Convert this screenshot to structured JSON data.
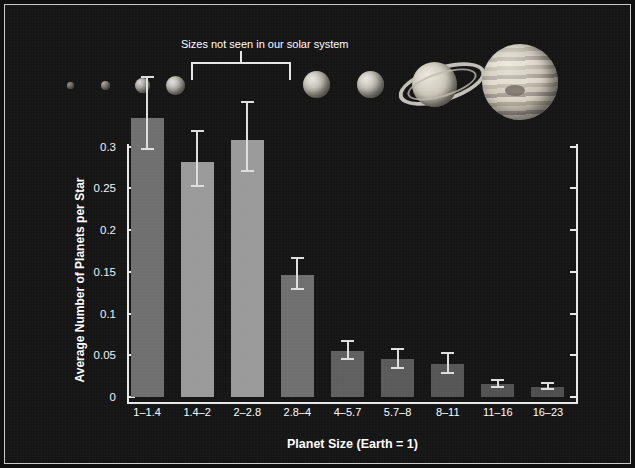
{
  "chart_data": {
    "type": "bar",
    "title": "",
    "xlabel": "Planet Size (Earth = 1)",
    "ylabel": "Average Number of Planets per Star",
    "categories": [
      "1–1.4",
      "1.4–2",
      "2–2.8",
      "2.8–4",
      "4–5.7",
      "5.7–8",
      "8–11",
      "11–16",
      "16–23"
    ],
    "values": [
      0.334,
      0.281,
      0.308,
      0.146,
      0.055,
      0.045,
      0.039,
      0.016,
      0.012
    ],
    "err_low": [
      0.296,
      0.252,
      0.27,
      0.128,
      0.044,
      0.033,
      0.027,
      0.011,
      0.008
    ],
    "err_high": [
      0.385,
      0.32,
      0.355,
      0.168,
      0.068,
      0.059,
      0.054,
      0.022,
      0.018
    ],
    "bar_colors": [
      "#6f6f6f",
      "#9a9a9a",
      "#9a9a9a",
      "#6f6f6f",
      "#5f5f5f",
      "#5a5a5a",
      "#565656",
      "#525252",
      "#4f4f4f"
    ],
    "ylim": [
      0,
      0.345
    ],
    "yticks": [
      0,
      0.05,
      0.1,
      0.15,
      0.2,
      0.25,
      0.3
    ],
    "ytick_labels": [
      "0",
      "0.05",
      "0.1",
      "0.15",
      "0.2",
      "0.25",
      "0.3"
    ],
    "grid": false,
    "legend": "none",
    "annotations": [
      {
        "text": "Sizes not seen in our solar system",
        "covers_categories": [
          "2–2.8",
          "2.8–4"
        ],
        "style": "bracket"
      }
    ]
  },
  "axes": {
    "y_title": "Average Number of Planets per Star",
    "x_title": "Planet Size (Earth = 1)"
  },
  "annotation": {
    "label": "Sizes not seen in our solar system"
  },
  "planets": [
    {
      "name": "planet-icon-earth-small",
      "size": 7,
      "kind": "rock"
    },
    {
      "name": "planet-icon-super-earth",
      "size": 9,
      "kind": "rock"
    },
    {
      "name": "planet-icon-mini-neptune",
      "size": 15,
      "kind": "ice"
    },
    {
      "name": "planet-icon-sub-neptune",
      "size": 19,
      "kind": "ice"
    },
    {
      "name": "planet-icon-neptune",
      "size": 27,
      "kind": "gas"
    },
    {
      "name": "planet-icon-uranus",
      "size": 27,
      "kind": "gas"
    },
    {
      "name": "planet-icon-saturn",
      "size": 45,
      "kind": "saturn"
    },
    {
      "name": "planet-icon-jupiter",
      "size": 76,
      "kind": "jupiter"
    }
  ],
  "colors": {
    "background": "#151516",
    "axis": "#e8e8e8",
    "text": "#ffffff",
    "bar_light": "#9a9a9a",
    "bar_dark": "#6f6f6f",
    "error_bar": "#dedede"
  }
}
